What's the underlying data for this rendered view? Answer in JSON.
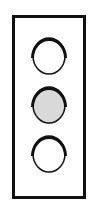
{
  "diagram": {
    "type": "traffic-light",
    "housing_color": "#111111",
    "lamps": [
      {
        "name": "top",
        "state": "off",
        "fill": "#ffffff",
        "top": 32
      },
      {
        "name": "middle",
        "state": "on",
        "fill": "#d9d9d9",
        "top": 81
      },
      {
        "name": "bottom",
        "state": "off",
        "fill": "#ffffff",
        "top": 130
      }
    ]
  }
}
